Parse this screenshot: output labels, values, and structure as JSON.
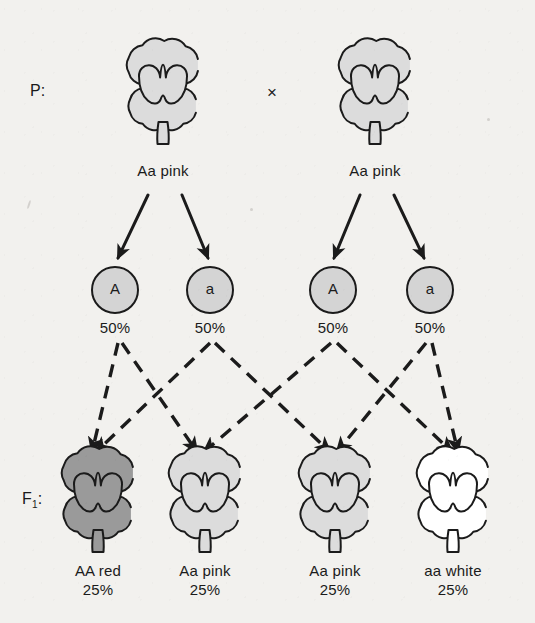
{
  "diagram": {
    "title_row_label": "P:",
    "f1_row_label": "F",
    "f1_row_subscript": "1",
    "f1_row_colon": ":",
    "cross_symbol": "×",
    "colors": {
      "background": "#f2f1ee",
      "outline": "#1b1b1b",
      "red_flower_fill": "#9a9a9a",
      "pink_flower_fill": "#dcdcdc",
      "white_flower_fill": "#ffffff",
      "gamete_fill": "#d4d4d4",
      "dash_line": "#1b1b1b"
    },
    "parents": [
      {
        "id": "parent-left",
        "genotype_label": "Aa pink",
        "phenotype": "pink",
        "cx": 163,
        "cy": 92,
        "fill": "pink"
      },
      {
        "id": "parent-right",
        "genotype_label": "Aa pink",
        "phenotype": "pink",
        "cx": 375,
        "cy": 92,
        "fill": "pink"
      }
    ],
    "gametes": [
      {
        "id": "gamete-1",
        "allele": "A",
        "percent": "50%",
        "cx": 115,
        "cy": 290
      },
      {
        "id": "gamete-2",
        "allele": "a",
        "percent": "50%",
        "cx": 210,
        "cy": 290
      },
      {
        "id": "gamete-3",
        "allele": "A",
        "percent": "50%",
        "cx": 333,
        "cy": 290
      },
      {
        "id": "gamete-4",
        "allele": "a",
        "percent": "50%",
        "cx": 430,
        "cy": 290
      }
    ],
    "offspring": [
      {
        "id": "offspring-1",
        "genotype_label": "AA red",
        "percent": "25%",
        "phenotype": "red",
        "cx": 98,
        "cy": 500,
        "fill": "red"
      },
      {
        "id": "offspring-2",
        "genotype_label": "Aa pink",
        "percent": "25%",
        "phenotype": "pink",
        "cx": 205,
        "cy": 500,
        "fill": "pink"
      },
      {
        "id": "offspring-3",
        "genotype_label": "Aa pink",
        "percent": "25%",
        "phenotype": "pink",
        "cx": 335,
        "cy": 500,
        "fill": "pink"
      },
      {
        "id": "offspring-4",
        "genotype_label": "aa white",
        "percent": "25%",
        "phenotype": "white",
        "cx": 453,
        "cy": 500,
        "fill": "white"
      }
    ],
    "meiosis_arrows": [
      {
        "id": "arrow-p1-g1",
        "from": [
          148,
          195
        ],
        "to": [
          118,
          258
        ]
      },
      {
        "id": "arrow-p1-g2",
        "from": [
          182,
          195
        ],
        "to": [
          208,
          258
        ]
      },
      {
        "id": "arrow-p2-g3",
        "from": [
          360,
          195
        ],
        "to": [
          334,
          258
        ]
      },
      {
        "id": "arrow-p2-g4",
        "from": [
          394,
          195
        ],
        "to": [
          424,
          258
        ]
      }
    ],
    "fertilization_lines": [
      {
        "id": "dash-g1-o1",
        "from_gamete": "gamete-1",
        "to_offspring": "offspring-1",
        "from": [
          118,
          343
        ],
        "to": [
          92,
          452
        ]
      },
      {
        "id": "dash-g1-o2",
        "from_gamete": "gamete-1",
        "to_offspring": "offspring-2",
        "from": [
          122,
          343
        ],
        "to": [
          197,
          452
        ]
      },
      {
        "id": "dash-g2-o1",
        "from_gamete": "gamete-2",
        "to_offspring": "offspring-1",
        "from": [
          210,
          343
        ],
        "to": [
          96,
          452
        ]
      },
      {
        "id": "dash-g2-o3",
        "from_gamete": "gamete-2",
        "to_offspring": "offspring-3",
        "from": [
          215,
          343
        ],
        "to": [
          330,
          452
        ]
      },
      {
        "id": "dash-g3-o2",
        "from_gamete": "gamete-3",
        "to_offspring": "offspring-2",
        "from": [
          331,
          343
        ],
        "to": [
          204,
          452
        ]
      },
      {
        "id": "dash-g3-o4",
        "from_gamete": "gamete-3",
        "to_offspring": "offspring-4",
        "from": [
          337,
          343
        ],
        "to": [
          452,
          452
        ]
      },
      {
        "id": "dash-g4-o3",
        "from_gamete": "gamete-4",
        "to_offspring": "offspring-3",
        "from": [
          426,
          343
        ],
        "to": [
          337,
          452
        ]
      },
      {
        "id": "dash-g4-o4",
        "from_gamete": "gamete-4",
        "to_offspring": "offspring-4",
        "from": [
          432,
          343
        ],
        "to": [
          458,
          452
        ]
      }
    ]
  }
}
